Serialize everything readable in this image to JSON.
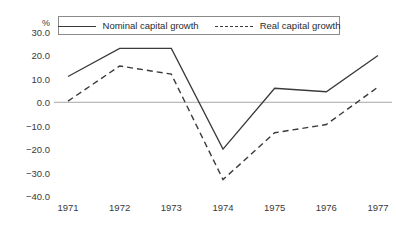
{
  "chart_data": {
    "type": "line",
    "title": "",
    "subtitle": "",
    "xlabel": "",
    "ylabel": "%",
    "unit_label": "%",
    "categories": [
      "1971",
      "1972",
      "1973",
      "1974",
      "1975",
      "1976",
      "1977"
    ],
    "x": [
      1971,
      1972,
      1973,
      1974,
      1975,
      1976,
      1977
    ],
    "series": [
      {
        "name": "Nominal capital growth",
        "style": "solid",
        "color": "#3a3a3a",
        "values": [
          11.0,
          23.0,
          23.0,
          -20.0,
          6.0,
          4.5,
          20.0
        ]
      },
      {
        "name": "Real capital growth",
        "style": "dashed",
        "color": "#3a3a3a",
        "values": [
          0.5,
          15.5,
          12.0,
          -33.0,
          -13.0,
          -9.5,
          6.5
        ]
      }
    ],
    "ylim": [
      -40.0,
      30.0
    ],
    "yticks": [
      30.0,
      20.0,
      10.0,
      0.0,
      -10.0,
      -20.0,
      -30.0,
      -40.0
    ],
    "ytick_labels": [
      "30.0",
      "20.0",
      "10.0",
      "0.0",
      "−10.0",
      "−20.0",
      "−30.0",
      "−40.0"
    ],
    "grid": false,
    "zero_line": true,
    "zero_line_color": "#a8a8a8",
    "legend_position": "top-inside",
    "legend": [
      "Nominal capital growth",
      "Real capital growth"
    ]
  },
  "legend": {
    "entries": [
      {
        "label": "Nominal capital growth",
        "style": "solid"
      },
      {
        "label": "Real capital growth",
        "style": "dashed"
      }
    ]
  }
}
